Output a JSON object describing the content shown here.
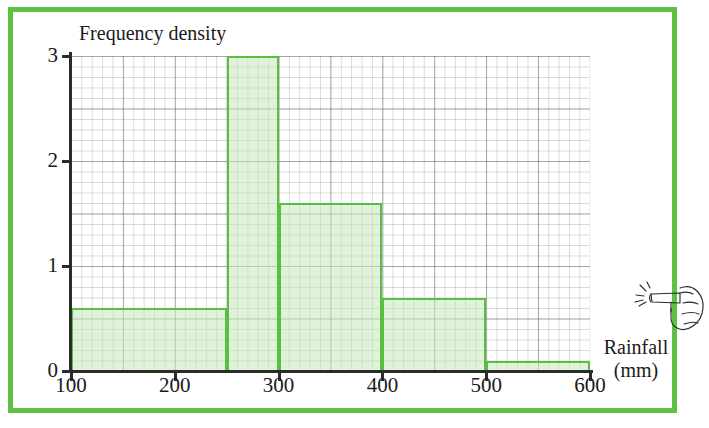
{
  "frame": {
    "border_color": "#5cc244"
  },
  "chart_data": {
    "type": "bar",
    "subtype": "histogram",
    "title": "",
    "ylabel": "Frequency density",
    "xlabel": "Rainfall",
    "xlabel_unit": "(mm)",
    "xlim": [
      100,
      600
    ],
    "ylim": [
      0,
      3
    ],
    "grid": true,
    "legend": null,
    "x_ticks": [
      "100",
      "200",
      "300",
      "400",
      "500",
      "600"
    ],
    "x_tick_values": [
      100,
      200,
      300,
      400,
      500,
      600
    ],
    "y_ticks": [
      "0",
      "1",
      "2",
      "3"
    ],
    "y_tick_values": [
      0,
      1,
      2,
      3
    ],
    "bin_edges": [
      100,
      250,
      300,
      400,
      500,
      600
    ],
    "categories": [
      "100-250",
      "250-300",
      "300-400",
      "400-500",
      "500-600"
    ],
    "values": [
      0.6,
      3.0,
      1.6,
      0.7,
      0.1
    ],
    "bars": [
      {
        "label": "100-250",
        "start": 100,
        "end": 250,
        "density": 0.6
      },
      {
        "label": "250-300",
        "start": 250,
        "end": 300,
        "density": 3.0
      },
      {
        "label": "300-400",
        "start": 300,
        "end": 400,
        "density": 1.6
      },
      {
        "label": "400-500",
        "start": 400,
        "end": 500,
        "density": 0.7
      },
      {
        "label": "500-600",
        "start": 500,
        "end": 600,
        "density": 0.1
      }
    ],
    "bar_fill_color": "#c6e8ba",
    "bar_stroke_color": "#59bf43"
  },
  "annotations": {
    "hand_icon": "pointing-hand-icon"
  }
}
